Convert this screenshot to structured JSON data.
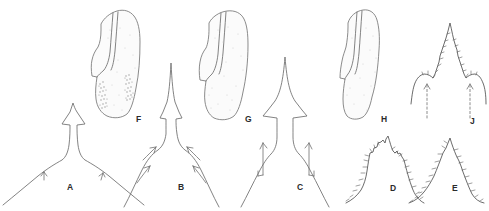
{
  "plate": {
    "title": "Taxonomic illustration plate",
    "background_color": "#ffffff",
    "line_color": "#6d6d6d",
    "label_color": "#2b2b2b",
    "width": 489,
    "height": 211,
    "figure_count": 10
  },
  "panels": [
    {
      "id": "A",
      "label": "A",
      "kind": "outline-profile",
      "description": "Median process profile, low broad apex with short lateral shoulders",
      "label_x": 67,
      "label_y": 190,
      "annotations": {
        "arrow_count": 2,
        "arrow_style": "small-chevron"
      }
    },
    {
      "id": "B",
      "label": "B",
      "kind": "outline-profile",
      "description": "Median process profile, tall narrow spine with acute lateral teeth",
      "label_x": 178,
      "label_y": 190,
      "annotations": {
        "arrow_count": 4,
        "arrow_style": "curved"
      }
    },
    {
      "id": "C",
      "label": "C",
      "kind": "outline-profile",
      "description": "Median process profile, tall spine with broad shoulders",
      "label_x": 297,
      "label_y": 190,
      "annotations": {
        "arrow_count": 2,
        "arrow_style": "long-straight-hooked"
      }
    },
    {
      "id": "D",
      "label": "D",
      "kind": "setose-profile",
      "description": "Setose median lobe, low apex fringed with fine setae",
      "label_x": 390,
      "label_y": 191,
      "annotations": {
        "arrow_count": 0,
        "setae": true
      }
    },
    {
      "id": "E",
      "label": "E",
      "kind": "setose-profile",
      "description": "Setose median lobe, tall triangular apex fringed with setae",
      "label_x": 452,
      "label_y": 191,
      "annotations": {
        "arrow_count": 0,
        "setae": true
      }
    },
    {
      "id": "F",
      "label": "F",
      "kind": "stippled-sclerite",
      "description": "Elongate sclerite, stippled with two dense granular patches",
      "label_x": 136,
      "label_y": 122,
      "annotations": {
        "granular_patches": 2,
        "stippled": true
      }
    },
    {
      "id": "G",
      "label": "G",
      "kind": "stippled-sclerite",
      "description": "Elongate sclerite, uniformly stippled without granular patches",
      "label_x": 245,
      "label_y": 122,
      "annotations": {
        "granular_patches": 0,
        "stippled": true
      }
    },
    {
      "id": "H",
      "label": "H",
      "kind": "stippled-sclerite",
      "description": "Narrow elongate sclerite, uniformly stippled",
      "label_x": 381,
      "label_y": 122,
      "annotations": {
        "granular_patches": 0,
        "stippled": true
      }
    },
    {
      "id": "J",
      "label": "J",
      "kind": "setose-profile",
      "description": "Setose median process, serrate margins with paired dashed arrows",
      "label_x": 470,
      "label_y": 124,
      "annotations": {
        "arrow_count": 2,
        "arrow_style": "dashed",
        "setae": true
      }
    }
  ]
}
